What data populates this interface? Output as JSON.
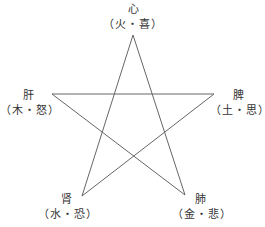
{
  "diagram": {
    "type": "five-element pentagram",
    "line_color": "#666666",
    "nodes": [
      {
        "id": "heart",
        "organ": "心",
        "detail": "（火・喜）"
      },
      {
        "id": "liver",
        "organ": "肝",
        "detail": "（木・怒）"
      },
      {
        "id": "spleen",
        "organ": "脾",
        "detail": "（土・思）"
      },
      {
        "id": "kidney",
        "organ": "肾",
        "detail": "（水・恐）"
      },
      {
        "id": "lung",
        "organ": "肺",
        "detail": "（金・悲）"
      }
    ]
  }
}
